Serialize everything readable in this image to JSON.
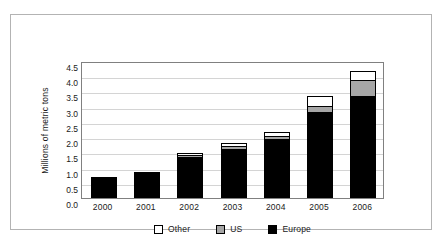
{
  "chart_data": {
    "type": "bar",
    "stacked": true,
    "title": "",
    "subtitle": "",
    "xlabel": "",
    "ylabel": "Millions of metric tons",
    "categories": [
      "2000",
      "2001",
      "2002",
      "2003",
      "2004",
      "2005",
      "2006"
    ],
    "series": [
      {
        "name": "Europe",
        "color": "#000000",
        "values": [
          0.7,
          0.87,
          1.35,
          1.62,
          1.95,
          2.83,
          3.36
        ]
      },
      {
        "name": "US",
        "color": "#a6a6a6",
        "values": [
          0.0,
          0.0,
          0.02,
          0.08,
          0.1,
          0.2,
          0.52
        ]
      },
      {
        "name": "Other",
        "color": "#ffffff",
        "values": [
          0.0,
          0.0,
          0.05,
          0.12,
          0.11,
          0.32,
          0.3
        ]
      }
    ],
    "totals": [
      0.7,
      0.87,
      1.42,
      1.82,
      2.16,
      3.35,
      4.18
    ],
    "ylim": [
      0.0,
      4.5
    ],
    "ytick_step": 0.5,
    "ytick_labels": [
      "4.5",
      "4.0",
      "3.5",
      "3.0",
      "2.5",
      "2.0",
      "1.5",
      "1.0",
      "0.5",
      "0.0"
    ],
    "grid": true,
    "legend_position": "bottom",
    "legend_order": [
      "Other",
      "US",
      "Europe"
    ]
  },
  "legend": {
    "entries": [
      {
        "label": "Other",
        "swatch": "white-square-icon"
      },
      {
        "label": "US",
        "swatch": "gray-square-icon"
      },
      {
        "label": "Europe",
        "swatch": "black-square-icon"
      }
    ]
  }
}
